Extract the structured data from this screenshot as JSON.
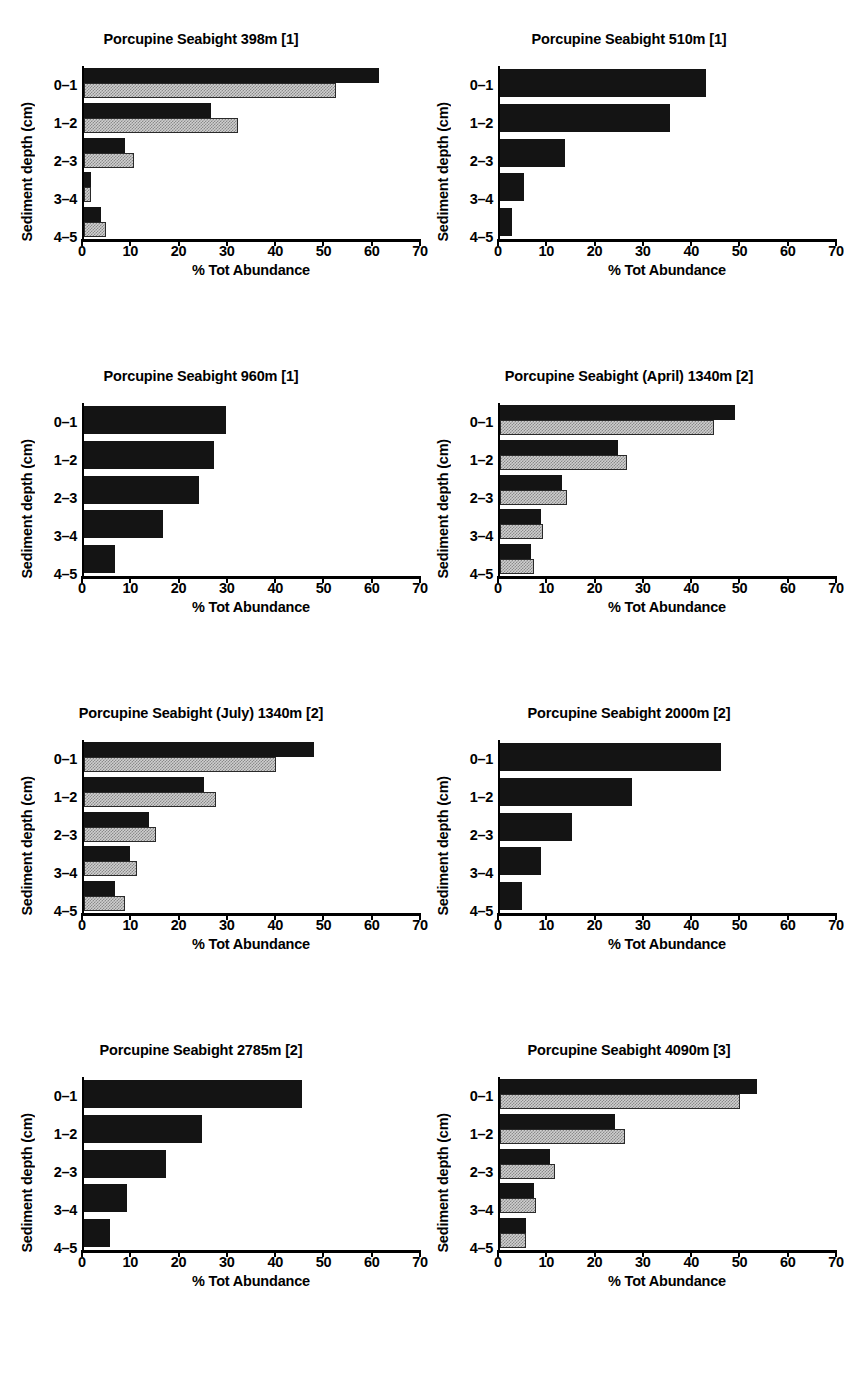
{
  "figure": {
    "axis_label_x": "% Tot Abundance",
    "axis_label_y": "Sediment depth (cm)",
    "categories": [
      "0–1",
      "1–2",
      "2–3",
      "3–4",
      "4–5"
    ],
    "xticks": [
      "0",
      "10",
      "20",
      "30",
      "40",
      "50",
      "60",
      "70"
    ],
    "colors": {
      "dark_series": "#141414",
      "light_series": "#cfcfcf",
      "axis": "#000000",
      "background": "#ffffff"
    }
  },
  "chart_data": [
    {
      "type": "bar",
      "title": "Porcupine Seabight 398m [1]",
      "orientation": "horizontal",
      "categories": [
        "0–1",
        "1–2",
        "2–3",
        "3–4",
        "4–5"
      ],
      "series": [
        {
          "name": "dark",
          "values": [
            61.5,
            26.5,
            8.5,
            1.5,
            3.5
          ]
        },
        {
          "name": "light",
          "values": [
            52.5,
            32.0,
            10.5,
            1.5,
            4.5
          ]
        }
      ],
      "xlabel": "% Tot Abundance",
      "ylabel": "Sediment depth (cm)",
      "xlim": [
        0,
        70
      ],
      "grid": false,
      "legend": "none"
    },
    {
      "type": "bar",
      "title": "Porcupine Seabight 510m [1]",
      "orientation": "horizontal",
      "categories": [
        "0–1",
        "1–2",
        "2–3",
        "3–4",
        "4–5"
      ],
      "series": [
        {
          "name": "dark",
          "values": [
            43.0,
            35.5,
            13.5,
            5.0,
            2.5
          ]
        }
      ],
      "xlabel": "% Tot Abundance",
      "ylabel": "Sediment depth (cm)",
      "xlim": [
        0,
        70
      ],
      "grid": false,
      "legend": "none"
    },
    {
      "type": "bar",
      "title": "Porcupine Seabight 960m [1]",
      "orientation": "horizontal",
      "categories": [
        "0–1",
        "1–2",
        "2–3",
        "3–4",
        "4–5"
      ],
      "series": [
        {
          "name": "dark",
          "values": [
            29.5,
            27.0,
            24.0,
            16.5,
            6.5
          ]
        }
      ],
      "xlabel": "% Tot Abundance",
      "ylabel": "Sediment depth (cm)",
      "xlim": [
        0,
        70
      ],
      "grid": false,
      "legend": "none"
    },
    {
      "type": "bar",
      "title": "Porcupine Seabight (April) 1340m [2]",
      "orientation": "horizontal",
      "categories": [
        "0–1",
        "1–2",
        "2–3",
        "3–4",
        "4–5"
      ],
      "series": [
        {
          "name": "dark",
          "values": [
            49.0,
            24.5,
            13.0,
            8.5,
            6.5
          ]
        },
        {
          "name": "light",
          "values": [
            44.5,
            26.5,
            14.0,
            9.0,
            7.0
          ]
        }
      ],
      "xlabel": "% Tot Abundance",
      "ylabel": "Sediment depth (cm)",
      "xlim": [
        0,
        70
      ],
      "grid": false,
      "legend": "none"
    },
    {
      "type": "bar",
      "title": "Porcupine Seabight (July) 1340m [2]",
      "orientation": "horizontal",
      "categories": [
        "0–1",
        "1–2",
        "2–3",
        "3–4",
        "4–5"
      ],
      "series": [
        {
          "name": "dark",
          "values": [
            48.0,
            25.0,
            13.5,
            9.5,
            6.5
          ]
        },
        {
          "name": "light",
          "values": [
            40.0,
            27.5,
            15.0,
            11.0,
            8.5
          ]
        }
      ],
      "xlabel": "% Tot Abundance",
      "ylabel": "Sediment depth (cm)",
      "xlim": [
        0,
        70
      ],
      "grid": false,
      "legend": "none"
    },
    {
      "type": "bar",
      "title": "Porcupine Seabight 2000m [2]",
      "orientation": "horizontal",
      "categories": [
        "0–1",
        "1–2",
        "2–3",
        "3–4",
        "4–5"
      ],
      "series": [
        {
          "name": "dark",
          "values": [
            46.0,
            27.5,
            15.0,
            8.5,
            4.5
          ]
        }
      ],
      "xlabel": "% Tot Abundance",
      "ylabel": "Sediment depth (cm)",
      "xlim": [
        0,
        70
      ],
      "grid": false,
      "legend": "none"
    },
    {
      "type": "bar",
      "title": "Porcupine Seabight 2785m [2]",
      "orientation": "horizontal",
      "categories": [
        "0–1",
        "1–2",
        "2–3",
        "3–4",
        "4–5"
      ],
      "series": [
        {
          "name": "dark",
          "values": [
            45.5,
            24.5,
            17.0,
            9.0,
            5.5
          ]
        }
      ],
      "xlabel": "% Tot Abundance",
      "ylabel": "Sediment depth (cm)",
      "xlim": [
        0,
        70
      ],
      "grid": false,
      "legend": "none"
    },
    {
      "type": "bar",
      "title": "Porcupine Seabight 4090m [3]",
      "orientation": "horizontal",
      "categories": [
        "0–1",
        "1–2",
        "2–3",
        "3–4",
        "4–5"
      ],
      "series": [
        {
          "name": "dark",
          "values": [
            53.5,
            24.0,
            10.5,
            7.0,
            5.5
          ]
        },
        {
          "name": "light",
          "values": [
            50.0,
            26.0,
            11.5,
            7.5,
            5.5
          ]
        }
      ],
      "xlabel": "% Tot Abundance",
      "ylabel": "Sediment depth (cm)",
      "xlim": [
        0,
        70
      ],
      "grid": false,
      "legend": "none"
    }
  ]
}
